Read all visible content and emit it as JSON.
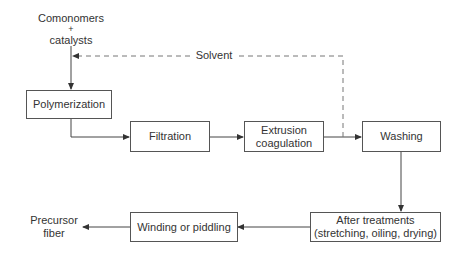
{
  "diagram": {
    "type": "process-flow",
    "inputs": {
      "line1": "Comonomers",
      "line2": "+",
      "line3": "catalysts"
    },
    "recycle": {
      "label": "Solvent",
      "style": "dashed"
    },
    "steps": [
      {
        "id": "polymerization",
        "line1": "Polymerization"
      },
      {
        "id": "filtration",
        "line1": "Filtration"
      },
      {
        "id": "extrusion",
        "line1": "Extrusion",
        "line2": "coagulation"
      },
      {
        "id": "washing",
        "line1": "Washing"
      },
      {
        "id": "after-treatments",
        "line1": "After treatments",
        "line2": "(stretching, oiling, drying)"
      },
      {
        "id": "winding",
        "line1": "Winding or piddling"
      }
    ],
    "output": {
      "line1": "Precursor",
      "line2": "fiber"
    },
    "colors": {
      "line": "#444444",
      "dashed": "#777777",
      "box_border": "#555555",
      "text": "#333333"
    }
  }
}
